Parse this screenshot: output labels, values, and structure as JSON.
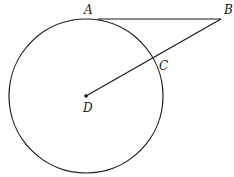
{
  "diagram": {
    "type": "geometry",
    "points": {
      "A": {
        "label": "A",
        "x": 98,
        "y": 19
      },
      "B": {
        "label": "B",
        "x": 221,
        "y": 19
      },
      "C": {
        "label": "C",
        "x": 153,
        "y": 58
      },
      "D": {
        "label": "D",
        "x": 86,
        "y": 96
      }
    },
    "circle": {
      "center": "D",
      "radius": 77
    },
    "segments": [
      {
        "from": "A",
        "to": "B"
      },
      {
        "from": "B",
        "to": "D"
      }
    ],
    "stroke_color": "#1a1a1a"
  }
}
